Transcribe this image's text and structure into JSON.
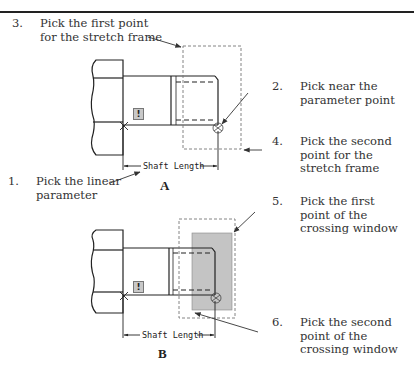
{
  "figure": {
    "panels": [
      {
        "id": "A",
        "label": "A",
        "dimension_label": "Shaft  Length",
        "warning_glyph": "!",
        "callouts": [
          {
            "number": "3.",
            "lines": [
              "Pick the first point",
              "for the stretch frame"
            ]
          },
          {
            "number": "2.",
            "lines": [
              "Pick near the",
              "parameter point"
            ]
          },
          {
            "number": "4.",
            "lines": [
              "Pick the second",
              "point for the",
              "stretch frame"
            ]
          },
          {
            "number": "1.",
            "lines": [
              "Pick the linear",
              "parameter"
            ]
          }
        ]
      },
      {
        "id": "B",
        "label": "B",
        "dimension_label": "Shaft  Length",
        "warning_glyph": "!",
        "callouts": [
          {
            "number": "5.",
            "lines": [
              "Pick the first",
              "point of the",
              "crossing window"
            ]
          },
          {
            "number": "6.",
            "lines": [
              "Pick the second",
              "point of the",
              "crossing window"
            ]
          }
        ]
      }
    ],
    "colors": {
      "line": "#222222",
      "dashed_frame": "#777777",
      "crossing_window_fill": "#c4c4c4",
      "text": "#333333"
    }
  }
}
